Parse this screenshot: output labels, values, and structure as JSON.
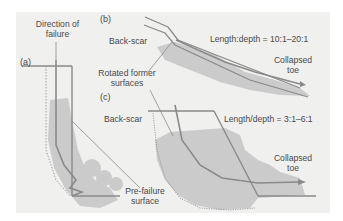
{
  "figure": {
    "panels": [
      {
        "id": "a",
        "label": "(a)"
      },
      {
        "id": "b",
        "label": "(b)"
      },
      {
        "id": "c",
        "label": "(c)"
      }
    ],
    "labels": {
      "direction_of_failure_1": "Direction of",
      "direction_of_failure_2": "failure",
      "back_scar_b": "Back-scar",
      "rotated_former_1": "Rotated former",
      "rotated_former_2": "surfaces",
      "ratio_b": "Length:depth = 10:1–20:1",
      "collapsed_toe_b_1": "Collapsed",
      "collapsed_toe_b_2": "toe",
      "back_scar_c": "Back-scar",
      "ratio_c": "Length/depth = 3:1–6:1",
      "collapsed_toe_c_1": "Collapsed",
      "collapsed_toe_c_2": "toe",
      "pre_failure_1": "Pre-failure",
      "pre_failure_2": "surface"
    },
    "colors": {
      "background": "#f0f0ef",
      "fill": "#c9c9c9",
      "line": "#8a8a8a",
      "text": "#4a4a4a"
    }
  }
}
